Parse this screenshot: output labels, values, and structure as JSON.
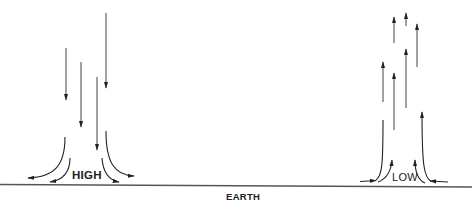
{
  "diagram": {
    "type": "atmospheric-pressure-airflow",
    "colors": {
      "line": "#333333",
      "ground": "#555555",
      "text": "#222222",
      "background": "#ffffff"
    },
    "ground": {
      "label": "EARTH"
    },
    "high": {
      "label": "HIGH",
      "description": "Descending air diverging outward at the surface",
      "vertical_arrows": [
        {
          "x": 66,
          "y1": 48,
          "y2": 100,
          "direction": "down"
        },
        {
          "x": 81,
          "y1": 62,
          "y2": 127,
          "direction": "down"
        },
        {
          "x": 97,
          "y1": 77,
          "y2": 150,
          "direction": "down"
        },
        {
          "x": 106,
          "y1": 13,
          "y2": 88,
          "direction": "down"
        }
      ],
      "surface_flows": [
        {
          "side": "left",
          "kind": "outer",
          "direction": "outward"
        },
        {
          "side": "left",
          "kind": "inner",
          "direction": "outward"
        },
        {
          "side": "right",
          "kind": "outer",
          "direction": "outward"
        },
        {
          "side": "right",
          "kind": "inner",
          "direction": "outward"
        }
      ]
    },
    "low": {
      "label": "LOW",
      "description": "Converging surface air rising upward",
      "vertical_arrows": [
        {
          "x": 383,
          "y1": 102,
          "y2": 63,
          "direction": "up"
        },
        {
          "x": 394,
          "y1": 130,
          "y2": 74,
          "direction": "up"
        },
        {
          "x": 394,
          "y1": 43,
          "y2": 18,
          "direction": "up"
        },
        {
          "x": 406,
          "y1": 25,
          "y2": 14,
          "direction": "up"
        },
        {
          "x": 406,
          "y1": 108,
          "y2": 50,
          "direction": "up"
        },
        {
          "x": 417,
          "y1": 67,
          "y2": 25,
          "direction": "up"
        },
        {
          "x": 422,
          "y1": 160,
          "y2": 112,
          "direction": "up"
        }
      ],
      "surface_flows": [
        {
          "side": "left",
          "kind": "horizontal-inflow",
          "direction": "inward"
        },
        {
          "side": "left",
          "kind": "inner",
          "direction": "upward"
        },
        {
          "side": "right",
          "kind": "horizontal-inflow",
          "direction": "inward"
        },
        {
          "side": "right",
          "kind": "inner",
          "direction": "upward"
        }
      ]
    }
  }
}
